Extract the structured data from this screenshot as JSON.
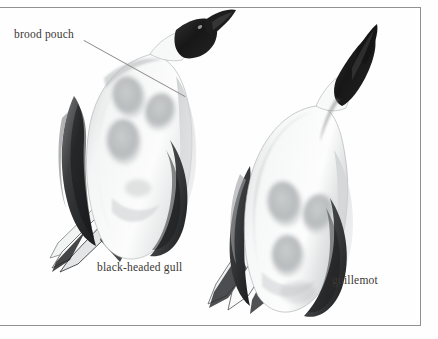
{
  "figure": {
    "kind": "scientific-illustration-plate",
    "background_color": "#fefefe",
    "frame": {
      "color": "#8d8d8d",
      "sides_visible": [
        "top",
        "right",
        "bottom"
      ],
      "left_edge": "bleeds off canvas"
    },
    "ink_colors": {
      "black": "#1a1a1a",
      "dark_grey": "#4a4a4a",
      "mid_grey": "#9b9b9b",
      "patch_grey": "#b9bcbd",
      "label_text": "#3a3734",
      "leader_line": "#8c8a88"
    }
  },
  "labels": {
    "brood_pouch": "brood pouch",
    "black_headed_gull": "black-headed gull",
    "guillemot": "guillemot"
  },
  "specimens": [
    {
      "name": "black-headed gull",
      "position": "left",
      "orientation": "head upper-right, tail lower-left",
      "head_color": "black",
      "body_color": "white",
      "brood_patches": 3
    },
    {
      "name": "guillemot",
      "position": "right",
      "orientation": "head upper-right, tail lower-left",
      "head_color": "black",
      "body_color": "white",
      "brood_patches": 3
    }
  ]
}
